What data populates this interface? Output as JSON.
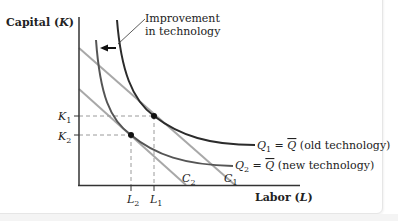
{
  "diagram": {
    "y_axis_label": "Capital (K)",
    "y_axis_label_prefix": "Capital (",
    "y_axis_label_var": "K",
    "y_axis_label_suffix": ")",
    "x_axis_label_prefix": "Labor (",
    "x_axis_label_var": "L",
    "x_axis_label_suffix": ")",
    "annotation_line1": "Improvement",
    "annotation_line2": "in technology",
    "y_ticks": [
      {
        "label": "K",
        "sub": "1"
      },
      {
        "label": "K",
        "sub": "2"
      }
    ],
    "x_ticks": [
      {
        "label": "L",
        "sub": "2"
      },
      {
        "label": "L",
        "sub": "1"
      }
    ],
    "isocost_lines": [
      {
        "label": "C",
        "sub": "1"
      },
      {
        "label": "C",
        "sub": "2"
      }
    ],
    "isoquants": [
      {
        "label": "Q",
        "sub": "1",
        "eq": " = ",
        "bar": "Q",
        "desc": " (old technology)"
      },
      {
        "label": "Q",
        "sub": "2",
        "eq": " = ",
        "bar": "Q",
        "desc": " (new technology)"
      }
    ],
    "colors": {
      "isoquant_old": "#2b2b2b",
      "isoquant_new": "#555555",
      "isocost": "#a8a8a8",
      "axis": "#333333",
      "dashed": "#9a9a9a"
    }
  }
}
